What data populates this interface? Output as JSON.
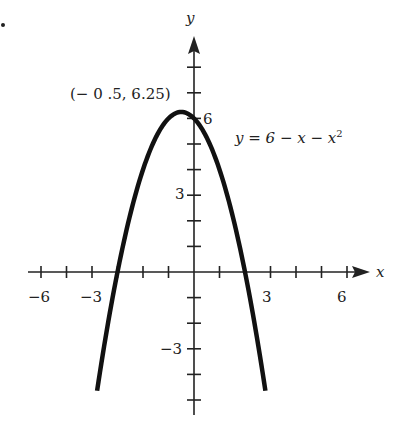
{
  "chart_data": {
    "type": "line",
    "title": "",
    "equation": "y = 6 − x − x²",
    "equation_parts": {
      "lhs": "y",
      "eq": "=",
      "c": "6",
      "m1": "−",
      "x": "x",
      "m2": "−",
      "x2": "x",
      "exp": "2"
    },
    "xlabel": "x",
    "ylabel": "y",
    "xlim": [
      -6.5,
      7
    ],
    "ylim": [
      -5.5,
      9
    ],
    "x_ticks": [
      -6,
      -5,
      -4,
      -3,
      -2,
      -1,
      1,
      2,
      3,
      4,
      5,
      6
    ],
    "y_ticks": [
      -5,
      -4,
      -3,
      -2,
      -1,
      1,
      2,
      3,
      4,
      5,
      6,
      7,
      8
    ],
    "x_tick_labels": [
      {
        "value": -6,
        "text": "−6"
      },
      {
        "value": -3,
        "text": "−3"
      },
      {
        "value": 3,
        "text": "3"
      },
      {
        "value": 6,
        "text": "6"
      }
    ],
    "y_tick_labels": [
      {
        "value": 6,
        "text": "6"
      },
      {
        "value": 3,
        "text": "3"
      },
      {
        "value": -3,
        "text": "−3"
      }
    ],
    "series": [
      {
        "name": "y = 6 − x − x²",
        "function": "6 - x - x^2",
        "x_range": [
          -3.8,
          2.8
        ],
        "x": [
          -3.8,
          -3,
          -2,
          -1,
          -0.5,
          0,
          1,
          2,
          2.8
        ],
        "y": [
          -4.64,
          0,
          4,
          6,
          6.25,
          6,
          4,
          0,
          -4.64
        ]
      }
    ],
    "annotations": [
      {
        "text": "(− 0 .5, 6.25)",
        "x": -0.5,
        "y": 6.25,
        "label": "vertex"
      }
    ],
    "grid": false,
    "legend": null
  },
  "labels": {
    "vertex": "(− 0 .5, 6.25)",
    "x_axis": "x",
    "y_axis": "y",
    "tick_x_neg6": "−6",
    "tick_x_neg3": "−3",
    "tick_x_3": "3",
    "tick_x_6": "6",
    "tick_y_6": "6",
    "tick_y_3": "3",
    "tick_y_neg3": "−3",
    "eq_lhs": "y = 6 − ",
    "eq_x1": "x",
    "eq_mid": " − ",
    "eq_x2": "x",
    "eq_exp": "2"
  }
}
